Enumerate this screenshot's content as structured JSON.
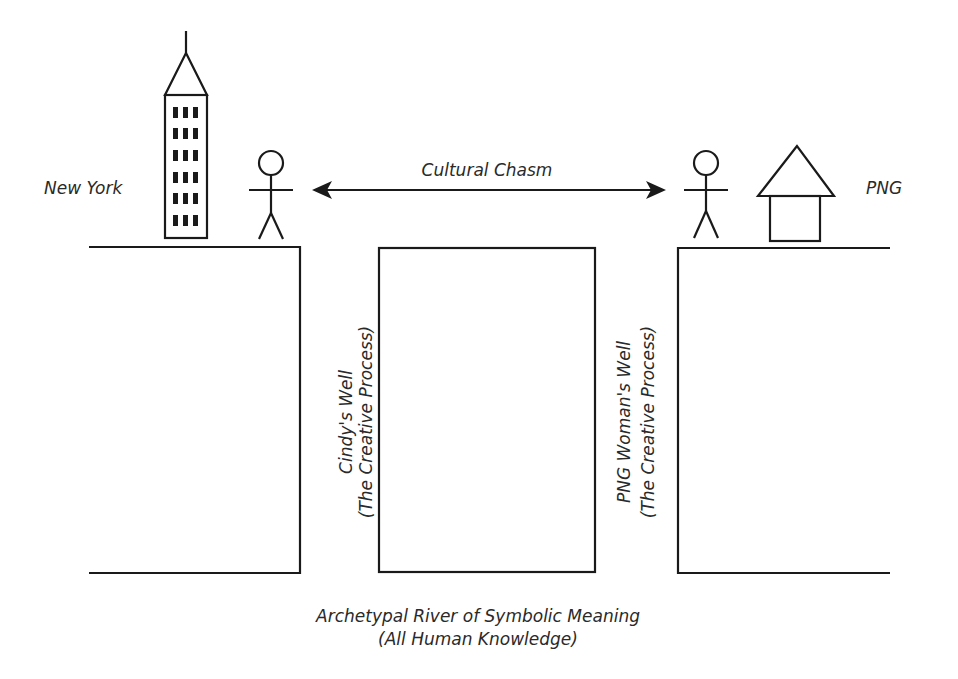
{
  "labels": {
    "left_place": "New York",
    "right_place": "PNG",
    "chasm": "Cultural Chasm",
    "left_well_line1": "Cindy's Well",
    "left_well_line2": "(The Creative Process)",
    "right_well_line1": "PNG Woman's Well",
    "right_well_line2": "(The Creative Process)",
    "river_line1": "Archetypal River of Symbolic Meaning",
    "river_line2": "(All Human Knowledge)"
  },
  "icons": {
    "left_building": "skyscraper-icon",
    "left_person": "stick-figure-icon",
    "right_person": "stick-figure-icon",
    "right_building": "house-icon",
    "connector": "double-arrow-icon"
  }
}
